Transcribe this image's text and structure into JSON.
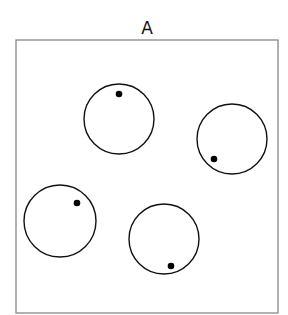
{
  "panel": {
    "title": "A",
    "frame": {
      "x": 16,
      "y": 40,
      "width": 262,
      "height": 273,
      "stroke": "#888888"
    },
    "circles": [
      {
        "cx": 119,
        "cy": 119,
        "r": 35,
        "dot": {
          "cx": 119,
          "cy": 94
        }
      },
      {
        "cx": 232,
        "cy": 139,
        "r": 35,
        "dot": {
          "cx": 214,
          "cy": 159
        }
      },
      {
        "cx": 60,
        "cy": 221,
        "r": 36,
        "dot": {
          "cx": 77,
          "cy": 203
        }
      },
      {
        "cx": 164,
        "cy": 239,
        "r": 35,
        "dot": {
          "cx": 171,
          "cy": 266
        }
      }
    ],
    "circle_stroke": "#111111",
    "dot_color": "#000000",
    "dot_radius": 3.3
  }
}
